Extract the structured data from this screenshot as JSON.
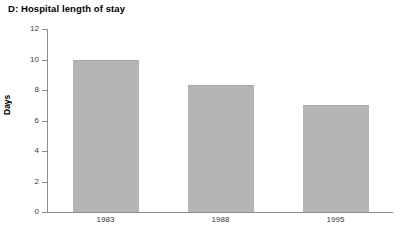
{
  "chart_data": {
    "type": "bar",
    "title": "D: Hospital length of stay",
    "xlabel": "",
    "ylabel": "Days",
    "categories": [
      "1983",
      "1988",
      "1995"
    ],
    "values": [
      10.0,
      8.3,
      7.0
    ],
    "ylim": [
      0,
      12
    ],
    "yticks": [
      0,
      2,
      4,
      6,
      8,
      10,
      12
    ],
    "ytick_labels": [
      "0",
      "2",
      "4",
      "6",
      "8",
      "10",
      "12"
    ],
    "grid": false,
    "legend": null,
    "bar_color": "#b5b5b5",
    "axis_color": "#8c8c8c"
  }
}
